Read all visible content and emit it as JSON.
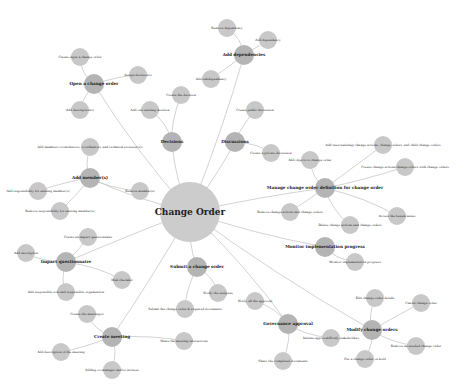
{
  "diagram": {
    "root": {
      "label": "Change Order",
      "x": 190,
      "y": 212,
      "r": 30
    },
    "hubs": [
      {
        "id": "h1",
        "label": "Open a change order",
        "x": 94,
        "y": 84,
        "r": 10
      },
      {
        "id": "h2",
        "label": "Add dependencies",
        "x": 244,
        "y": 55,
        "r": 10
      },
      {
        "id": "h3",
        "label": "Decisions",
        "x": 172,
        "y": 142,
        "r": 10
      },
      {
        "id": "h4",
        "label": "Discussions",
        "x": 235,
        "y": 142,
        "r": 10
      },
      {
        "id": "h5",
        "label": "Add member(s)",
        "x": 90,
        "y": 178,
        "r": 10
      },
      {
        "id": "h6",
        "label": "Manage change order definition for change order",
        "x": 325,
        "y": 188,
        "r": 10
      },
      {
        "id": "h7",
        "label": "Monitor implementation progress",
        "x": 325,
        "y": 247,
        "r": 10
      },
      {
        "id": "h8",
        "label": "Impact questionnaire",
        "x": 66,
        "y": 262,
        "r": 10
      },
      {
        "id": "h9",
        "label": "Submit a change order",
        "x": 197,
        "y": 267,
        "r": 10
      },
      {
        "id": "h10",
        "label": "Governance approval",
        "x": 288,
        "y": 324,
        "r": 10
      },
      {
        "id": "h11",
        "label": "Modify change orders",
        "x": 372,
        "y": 330,
        "r": 10
      },
      {
        "id": "h12",
        "label": "Create meeting",
        "x": 112,
        "y": 337,
        "r": 10
      }
    ],
    "leaves": [
      {
        "hub": "h1",
        "label": "Create input a change order",
        "x": 80,
        "y": 57
      },
      {
        "hub": "h1",
        "label": "Assign decision(s)",
        "x": 138,
        "y": 75
      },
      {
        "hub": "h1",
        "label": "Add description(s)",
        "x": 80,
        "y": 110
      },
      {
        "hub": "h2",
        "label": "Remove dependency",
        "x": 227,
        "y": 28
      },
      {
        "hub": "h2",
        "label": "Add dependency",
        "x": 268,
        "y": 40
      },
      {
        "hub": "h2",
        "label": "Add subdependency",
        "x": 211,
        "y": 79
      },
      {
        "hub": "h3",
        "label": "Create the decision",
        "x": 181,
        "y": 95
      },
      {
        "hub": "h3",
        "label": "Add one existing decision",
        "x": 150,
        "y": 110
      },
      {
        "hub": "h4",
        "label": "Create public discussion",
        "x": 255,
        "y": 110
      },
      {
        "hub": "h4",
        "label": "Create a private discussion",
        "x": 271,
        "y": 153
      },
      {
        "hub": "h5",
        "label": "Add members (contributors, coordinators, and technical reviewer(s))",
        "x": 90,
        "y": 147
      },
      {
        "hub": "h5",
        "label": "Add responsibility for existing member(s)",
        "x": 38,
        "y": 191
      },
      {
        "hub": "h5",
        "label": "Remove member(s)",
        "x": 140,
        "y": 191
      },
      {
        "hub": "h5",
        "label": "Remove responsibility for existing member(s)",
        "x": 60,
        "y": 211
      },
      {
        "hub": "h6",
        "label": "Add objects to change order",
        "x": 310,
        "y": 160
      },
      {
        "hub": "h6",
        "label": "Add (new/existing) change actions, change orders, and child change orders",
        "x": 383,
        "y": 145
      },
      {
        "hub": "h6",
        "label": "Create change actions/change orders with change orders",
        "x": 405,
        "y": 167
      },
      {
        "hub": "h6",
        "label": "Remove change actions and change orders",
        "x": 290,
        "y": 212
      },
      {
        "hub": "h6",
        "label": "Delete change actions and change orders",
        "x": 350,
        "y": 225
      },
      {
        "hub": "h6",
        "label": "Access the beneficiaries",
        "x": 397,
        "y": 216
      },
      {
        "hub": "h7",
        "label": "Monitor implementation progress",
        "x": 355,
        "y": 262
      },
      {
        "hub": "h8",
        "label": "Create an impact questionnaire",
        "x": 88,
        "y": 237
      },
      {
        "hub": "h8",
        "label": "Add description",
        "x": 26,
        "y": 253
      },
      {
        "hub": "h8",
        "label": "Mail checklist",
        "x": 122,
        "y": 280
      },
      {
        "hub": "h8",
        "label": "Add responsible role and responsible organization",
        "x": 66,
        "y": 292
      },
      {
        "hub": "h9",
        "label": "Notify the assignee",
        "x": 218,
        "y": 293
      },
      {
        "hub": "h9",
        "label": "Submit the change order & required documents",
        "x": 185,
        "y": 309
      },
      {
        "hub": "h10",
        "label": "Notify all the approval",
        "x": 255,
        "y": 301
      },
      {
        "hub": "h10",
        "label": "Initiate approval/Notify stakeholders",
        "x": 331,
        "y": 338
      },
      {
        "hub": "h10",
        "label": "Share the completed documents",
        "x": 283,
        "y": 361
      },
      {
        "hub": "h11",
        "label": "Edit change order details",
        "x": 375,
        "y": 298
      },
      {
        "hub": "h11",
        "label": "Cancel change order",
        "x": 421,
        "y": 303
      },
      {
        "hub": "h11",
        "label": "Remove un-needed change order",
        "x": 416,
        "y": 346
      },
      {
        "hub": "h11",
        "label": "Put a change order on hold",
        "x": 365,
        "y": 359
      },
      {
        "hub": "h12",
        "label": "Create the meeting(s)",
        "x": 87,
        "y": 314
      },
      {
        "hub": "h12",
        "label": "Share the meeting interactions",
        "x": 184,
        "y": 341
      },
      {
        "hub": "h12",
        "label": "Add description of the meeting",
        "x": 61,
        "y": 352
      },
      {
        "hub": "h12",
        "label": "Adding co-manager and/or invitees",
        "x": 112,
        "y": 370
      }
    ]
  }
}
